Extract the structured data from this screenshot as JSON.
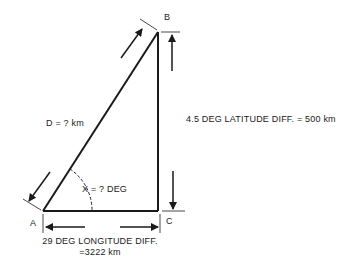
{
  "diagram": {
    "type": "right-triangle-navigation",
    "vertices": {
      "A": {
        "label": "A",
        "x": 43,
        "y": 211
      },
      "B": {
        "label": "B",
        "x": 158,
        "y": 32
      },
      "C": {
        "label": "C",
        "x": 158,
        "y": 211
      }
    },
    "labels": {
      "vertex_a": "A",
      "vertex_b": "B",
      "vertex_c": "C",
      "hypotenuse": "D = ? km",
      "angle": "X = ? DEG",
      "latitude": "4.5 DEG  LATITUDE DIFF. = 500 km",
      "longitude_line1": "29 DEG  LONGITUDE DIFF.",
      "longitude_line2": "=3222 km"
    },
    "colors": {
      "line": "#1a1a1a",
      "background": "#ffffff"
    }
  }
}
